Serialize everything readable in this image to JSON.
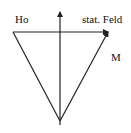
{
  "diagram": {
    "type": "vector-diagram",
    "labels": {
      "h0": "Ho",
      "static_field": "stat. Feld",
      "magnetization": "M"
    },
    "colors": {
      "stroke": "#222222",
      "text": "#111111",
      "background": "#ffffff"
    },
    "vectors": [
      {
        "name": "static-field-vector",
        "from": [
          60,
          125
        ],
        "to": [
          60,
          12
        ],
        "arrow": true
      },
      {
        "name": "magnetization-vector",
        "from": [
          60,
          121
        ],
        "to": [
          108,
          32
        ],
        "arrow": true
      },
      {
        "name": "h0-vector",
        "from": [
          13,
          32
        ],
        "to": [
          108,
          32
        ],
        "arrow": true
      },
      {
        "name": "left-edge",
        "from": [
          13,
          32
        ],
        "to": [
          60,
          121
        ],
        "arrow": false
      }
    ]
  }
}
